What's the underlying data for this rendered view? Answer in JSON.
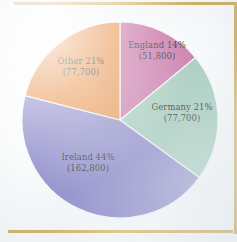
{
  "figure": {
    "background_color": "#f8fafb",
    "rule_color": "#c9a44a"
  },
  "chart_data": {
    "type": "pie",
    "title": "",
    "subtitle": "",
    "xlabel": "",
    "ylabel": "",
    "legend_position": "none",
    "grid": false,
    "label_format": "{name} {percent}% ({value})",
    "start_angle_deg": 0,
    "direction": "clockwise",
    "categories": [
      "England",
      "Germany",
      "Ireland",
      "Other"
    ],
    "values": [
      51800,
      77700,
      162800,
      77700
    ],
    "percents": [
      14,
      21,
      44,
      21
    ],
    "colors": [
      "#cc7cac",
      "#a7cdbd",
      "#8f8dcb",
      "#e89550"
    ],
    "slices": [
      {
        "name": "England",
        "percent_text": "England 14%",
        "value_text": "(51,800)",
        "percent": 14,
        "value": 51800,
        "color": "#cc7cac"
      },
      {
        "name": "Germany",
        "percent_text": "Germany 21%",
        "value_text": "(77,700)",
        "percent": 21,
        "value": 77700,
        "color": "#a7cdbd"
      },
      {
        "name": "Ireland",
        "percent_text": "Ireland 44%",
        "value_text": "(162,800)",
        "percent": 44,
        "value": 162800,
        "color": "#8f8dcb"
      },
      {
        "name": "Other",
        "percent_text": "Other 21%",
        "value_text": "(77,700)",
        "percent": 21,
        "value": 77700,
        "color": "#e89550"
      }
    ]
  }
}
